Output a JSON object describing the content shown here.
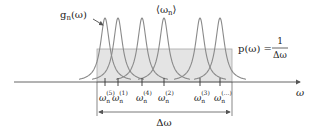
{
  "diagram": {
    "type": "lorentzian-frequency-distribution",
    "colors": {
      "curve": "#8a8a8a",
      "shade_fill": "#e4e4e4",
      "shade_stroke": "#a8a8a8",
      "axis": "#555555",
      "text": "#222222"
    },
    "axis": {
      "label": "ω"
    },
    "curve_label": {
      "text": "g",
      "subscript": "n",
      "arg": "(ω)"
    },
    "mean_label": {
      "text": "⟨ω",
      "subscript": "n",
      "close": "⟩"
    },
    "density_label": {
      "lhs": "p(ω) =",
      "numerator": "1",
      "denominator": "Δω"
    },
    "width_label": "Δω",
    "peaks": [
      {
        "x": 105,
        "label_sup": "(5)"
      },
      {
        "x": 118,
        "label_sup": "(1)"
      },
      {
        "x": 142,
        "label_sup": "(4)"
      },
      {
        "x": 164,
        "label_sup": "(2)"
      },
      {
        "x": 200,
        "label_sup": "(3)"
      },
      {
        "x": 220,
        "label_sup": "(…)"
      }
    ],
    "tick_label_base": "ω",
    "tick_label_sub": "n"
  }
}
